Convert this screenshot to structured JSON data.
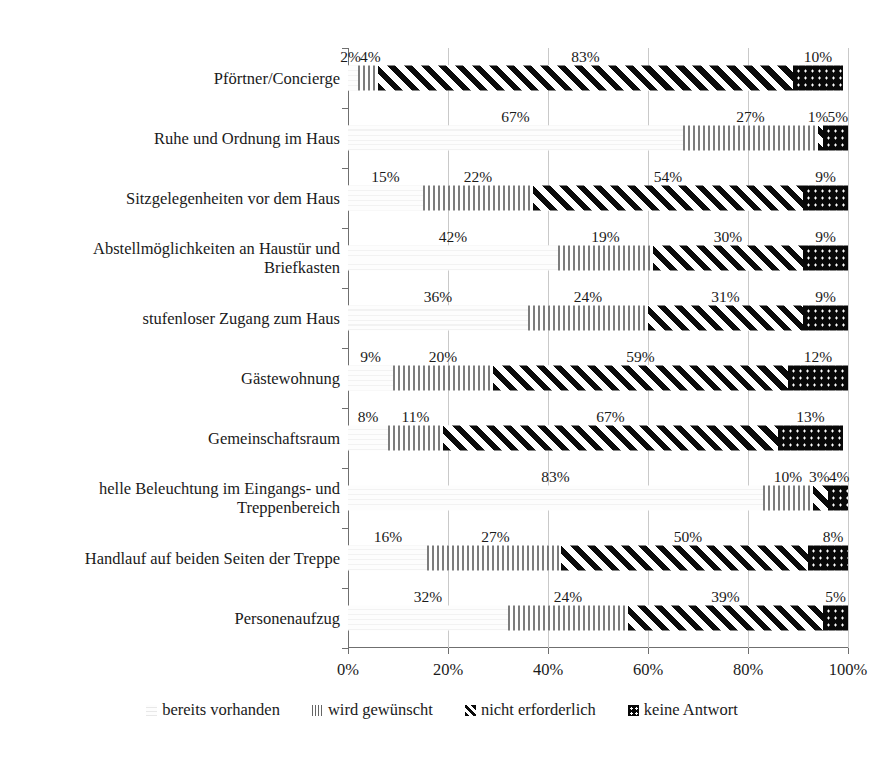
{
  "chart_data": {
    "type": "bar",
    "orientation": "horizontal",
    "stacked": true,
    "stack_mode": "percent",
    "title": "",
    "xlabel": "",
    "ylabel": "",
    "xlim": [
      0,
      100
    ],
    "xticks": [
      "0%",
      "20%",
      "40%",
      "60%",
      "80%",
      "100%"
    ],
    "xtick_values": [
      0,
      20,
      40,
      60,
      80,
      100
    ],
    "grid": "vertical",
    "legend_position": "bottom",
    "value_suffix": "%",
    "categories": [
      "Pförtner/Concierge",
      "Ruhe und Ordnung im Haus",
      "Sitzgelegenheiten vor dem Haus",
      "Abstellmöglichkeiten an Haustür und Briefkasten",
      "stufenloser Zugang zum Haus",
      "Gästewohnung",
      "Gemeinschaftsraum",
      "helle Beleuchtung im Eingangs- und Treppenbereich",
      "Handlauf auf beiden Seiten der Treppe",
      "Personenaufzug"
    ],
    "category_lines": [
      [
        "Pförtner/Concierge"
      ],
      [
        "Ruhe und Ordnung im Haus"
      ],
      [
        "Sitzgelegenheiten vor dem Haus"
      ],
      [
        "Abstellmöglichkeiten an Haustür und",
        "Briefkasten"
      ],
      [
        "stufenloser Zugang zum Haus"
      ],
      [
        "Gästewohnung"
      ],
      [
        "Gemeinschaftsraum"
      ],
      [
        "helle Beleuchtung im Eingangs- und",
        "Treppenbereich"
      ],
      [
        "Handlauf auf beiden Seiten der Treppe"
      ],
      [
        "Personenaufzug"
      ]
    ],
    "series": [
      {
        "name": "bereits vorhanden",
        "pattern": "blank",
        "values": [
          2,
          67,
          15,
          42,
          36,
          9,
          8,
          83,
          16,
          32
        ]
      },
      {
        "name": "wird gewünscht",
        "pattern": "vertical-lines",
        "values": [
          4,
          27,
          22,
          19,
          24,
          20,
          11,
          10,
          27,
          24
        ]
      },
      {
        "name": "nicht erforderlich",
        "pattern": "diagonal-hatch",
        "values": [
          83,
          1,
          54,
          30,
          31,
          59,
          67,
          3,
          50,
          39
        ]
      },
      {
        "name": "keine Antwort",
        "pattern": "black-dots",
        "values": [
          10,
          5,
          9,
          9,
          9,
          12,
          13,
          4,
          8,
          5
        ]
      }
    ],
    "labels": [
      [
        "2%",
        "4%",
        "83%",
        "10%"
      ],
      [
        "67%",
        "27%",
        "1%",
        "5%"
      ],
      [
        "15%",
        "22%",
        "54%",
        "9%"
      ],
      [
        "42%",
        "19%",
        "30%",
        "9%"
      ],
      [
        "36%",
        "24%",
        "31%",
        "9%"
      ],
      [
        "9%",
        "20%",
        "59%",
        "12%"
      ],
      [
        "8%",
        "11%",
        "67%",
        "13%"
      ],
      [
        "83%",
        "10%",
        "3%",
        "4%"
      ],
      [
        "16%",
        "27%",
        "50%",
        "8%"
      ],
      [
        "32%",
        "24%",
        "39%",
        "5%"
      ]
    ]
  },
  "legend": {
    "items": [
      {
        "label": "bereits vorhanden",
        "key": "k0"
      },
      {
        "label": "wird gewünscht",
        "key": "k1"
      },
      {
        "label": "nicht erforderlich",
        "key": "k2"
      },
      {
        "label": "keine Antwort",
        "key": "k3"
      }
    ]
  },
  "colors": {
    "bar_dark": "#080808",
    "bar_lines": "#7d7d7d",
    "gridline": "#c9c9c9",
    "axis": "#6f6f6f",
    "text": "#1a1a1a",
    "background": "#ffffff"
  }
}
